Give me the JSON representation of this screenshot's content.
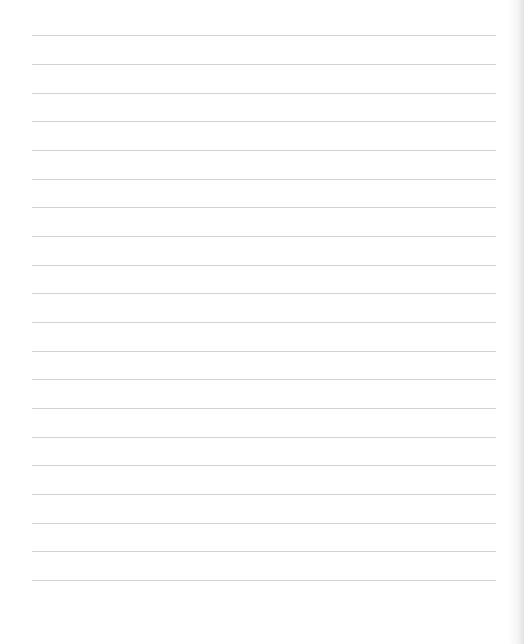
{
  "sheet": {
    "type": "lined-paper",
    "background_color": "#ffffff",
    "line_color": "#d2d2d2",
    "line_left": 32,
    "line_right": 496,
    "line_count": 20,
    "lines_y": [
      35,
      64,
      93,
      121,
      150,
      179,
      207,
      236,
      265,
      293,
      322,
      351,
      379,
      408,
      437,
      465,
      494,
      523,
      551,
      580
    ]
  }
}
